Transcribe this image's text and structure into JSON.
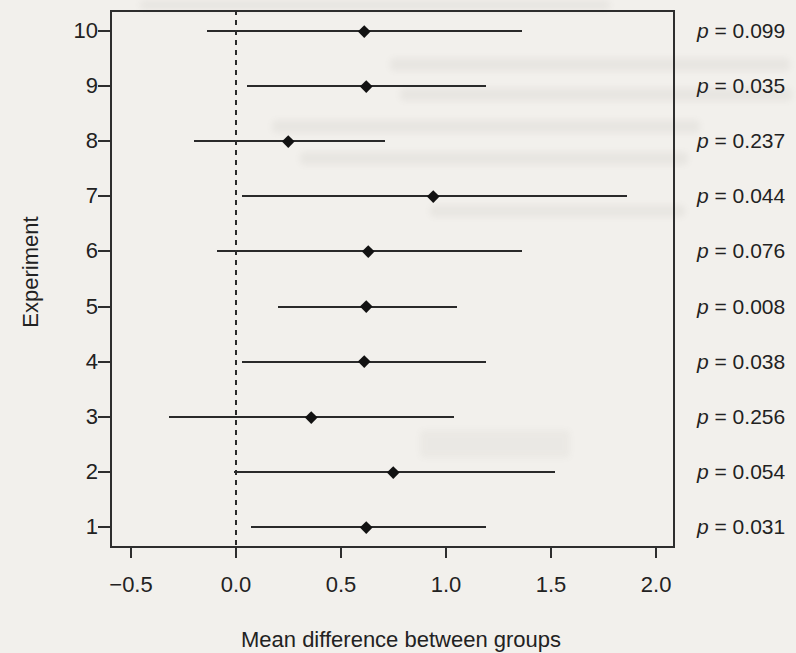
{
  "page": {
    "background_color": "#f2f0ec",
    "ink_color": "#222222",
    "line_color": "#2a2a2a"
  },
  "chart_data": {
    "type": "forest",
    "title": "",
    "xlabel": "Mean difference between groups",
    "ylabel": "Experiment",
    "xlim": [
      -0.6,
      2.09
    ],
    "x_tick_values": [
      -0.5,
      0.0,
      0.5,
      1.0,
      1.5,
      2.0
    ],
    "x_tick_labels": [
      "−0.5",
      "0.0",
      "0.5",
      "1.0",
      "1.5",
      "2.0"
    ],
    "reference_line_x": 0.0,
    "grid": false,
    "legend": "none",
    "p_symbol": "p",
    "rows": [
      {
        "experiment": "10",
        "mean": 0.61,
        "ci_low": -0.14,
        "ci_high": 1.36,
        "p": 0.099,
        "p_text": "= 0.099"
      },
      {
        "experiment": "9",
        "mean": 0.62,
        "ci_low": 0.05,
        "ci_high": 1.19,
        "p": 0.035,
        "p_text": "= 0.035"
      },
      {
        "experiment": "8",
        "mean": 0.25,
        "ci_low": -0.2,
        "ci_high": 0.71,
        "p": 0.237,
        "p_text": "= 0.237"
      },
      {
        "experiment": "7",
        "mean": 0.94,
        "ci_low": 0.03,
        "ci_high": 1.86,
        "p": 0.044,
        "p_text": "= 0.044"
      },
      {
        "experiment": "6",
        "mean": 0.63,
        "ci_low": -0.09,
        "ci_high": 1.36,
        "p": 0.076,
        "p_text": "= 0.076"
      },
      {
        "experiment": "5",
        "mean": 0.62,
        "ci_low": 0.2,
        "ci_high": 1.05,
        "p": 0.008,
        "p_text": "= 0.008"
      },
      {
        "experiment": "4",
        "mean": 0.61,
        "ci_low": 0.03,
        "ci_high": 1.19,
        "p": 0.038,
        "p_text": "= 0.038"
      },
      {
        "experiment": "3",
        "mean": 0.36,
        "ci_low": -0.32,
        "ci_high": 1.04,
        "p": 0.256,
        "p_text": "= 0.256"
      },
      {
        "experiment": "2",
        "mean": 0.75,
        "ci_low": -0.01,
        "ci_high": 1.52,
        "p": 0.054,
        "p_text": "= 0.054"
      },
      {
        "experiment": "1",
        "mean": 0.62,
        "ci_low": 0.07,
        "ci_high": 1.19,
        "p": 0.031,
        "p_text": "= 0.031"
      }
    ]
  }
}
